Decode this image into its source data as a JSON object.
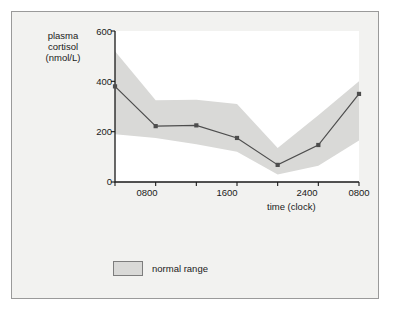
{
  "chart_data": {
    "type": "line",
    "title": "",
    "xlabel": "time (clock)",
    "ylabel": "plasma\ncortisol\n(nmol/L)",
    "ylabel_lines": [
      "plasma",
      "cortisol",
      "(nmol/L)"
    ],
    "x": [
      800,
      1200,
      1600,
      2000,
      2400,
      400,
      800
    ],
    "categories": [
      "0800",
      "1200",
      "1600",
      "2000",
      "2400",
      "0400",
      "0800"
    ],
    "xticklabels": [
      "0800",
      "1600",
      "2400",
      "0800"
    ],
    "xticklabel_positions": [
      800,
      1600,
      2400,
      800
    ],
    "yticklabels": [
      "0",
      "200",
      "400",
      "600"
    ],
    "ylim": [
      0,
      600
    ],
    "xlim": [
      800,
      3200
    ],
    "grid": false,
    "series": [
      {
        "name": "plasma cortisol",
        "values": [
          380,
          222,
          225,
          175,
          68,
          147,
          350
        ],
        "marker": "square",
        "color": "#4d4d4d"
      }
    ],
    "band": {
      "name": "normal range",
      "upper": [
        520,
        325,
        327,
        310,
        135,
        265,
        400
      ],
      "lower": [
        190,
        175,
        150,
        120,
        30,
        65,
        165
      ],
      "color": "#d9d9d7"
    },
    "legend": {
      "position": "below-left",
      "entries": [
        {
          "label": "normal range",
          "color": "#d9d9d7",
          "border": "#7d7d7d"
        }
      ]
    }
  },
  "axis": {
    "y_ticks": [
      "600",
      "400",
      "200",
      "0"
    ],
    "x_ticks": [
      "0800",
      "1600",
      "2400",
      "0800"
    ],
    "x_title": "time (clock)",
    "y_title_lines": [
      "plasma",
      "cortisol",
      "(nmol/L)"
    ]
  },
  "legend": {
    "normal_range_label": "normal range"
  },
  "colors": {
    "frame_background": "#f2f2f0",
    "frame_border": "#9a9a9a",
    "plot_background": "#ffffff",
    "band_fill": "#d9d9d7",
    "line": "#4d4d4d",
    "axis": "#1a1a1a",
    "text": "#1a1a1a"
  }
}
